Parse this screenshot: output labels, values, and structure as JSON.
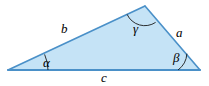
{
  "figure": {
    "name": "labeled-triangle",
    "canvas": {
      "width": 209,
      "height": 86
    },
    "colors": {
      "background": "#ffffff",
      "fill": "#c5e3f6",
      "stroke": "#4a90c8",
      "arc": "#1a1a1a",
      "label": "#000000"
    },
    "vertices": [
      {
        "name": "vertex-left",
        "x": 8,
        "y": 70
      },
      {
        "name": "vertex-top",
        "x": 145,
        "y": 6
      },
      {
        "name": "vertex-right",
        "x": 200,
        "y": 70
      }
    ],
    "sides": [
      {
        "name": "side-b",
        "label": "b",
        "from": "vertex-left",
        "to": "vertex-top"
      },
      {
        "name": "side-a",
        "label": "a",
        "from": "vertex-top",
        "to": "vertex-right"
      },
      {
        "name": "side-c",
        "label": "c",
        "from": "vertex-left",
        "to": "vertex-right"
      }
    ],
    "angles": [
      {
        "name": "angle-alpha",
        "label": "α",
        "at": "vertex-left"
      },
      {
        "name": "angle-beta",
        "label": "β",
        "at": "vertex-right"
      },
      {
        "name": "angle-gamma",
        "label": "γ",
        "at": "vertex-top"
      }
    ]
  }
}
